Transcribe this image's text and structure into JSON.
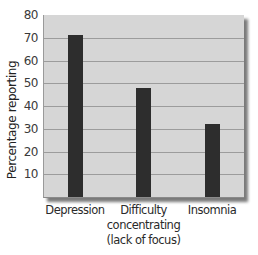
{
  "chart_data": {
    "type": "bar",
    "title": "",
    "xlabel": "",
    "ylabel": "Percentage reporting",
    "categories": [
      "Depression",
      "Difficulty concentrating (lack of focus)",
      "Insomnia"
    ],
    "category_label_lines": [
      [
        "Depression"
      ],
      [
        "Difficulty",
        "concentrating",
        "(lack of focus)"
      ],
      [
        "Insomnia"
      ]
    ],
    "values": [
      71,
      48,
      32
    ],
    "ylim": [
      0,
      80
    ],
    "yticks": [
      10,
      20,
      30,
      40,
      50,
      60,
      70,
      80
    ],
    "grid": true,
    "legend": null,
    "colors": {
      "bar": "#2d2d2d",
      "plot_background": "#d6d6d6",
      "gridline": "#9c9c9c"
    }
  }
}
